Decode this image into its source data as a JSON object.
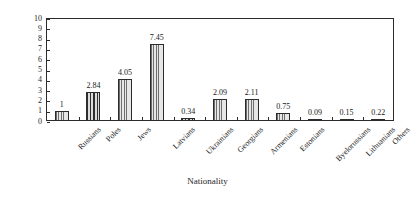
{
  "chart_data": {
    "type": "bar",
    "title": "",
    "xlabel": "Nationality",
    "ylabel": "Percentage",
    "ylim": [
      0,
      10
    ],
    "ytick_labels": [
      "0",
      "1",
      "2",
      "3",
      "4",
      "5",
      "6",
      "7",
      "8",
      "9",
      "10"
    ],
    "ytick_values": [
      0,
      1,
      2,
      3,
      4,
      5,
      6,
      7,
      8,
      9,
      10
    ],
    "grid": false,
    "legend": "none",
    "categories": [
      "Russians",
      "Poles",
      "Jews",
      "Latvians",
      "Ukrainians",
      "Georgians",
      "Armenians",
      "Estonians",
      "Byelorussians",
      "Lithuanians",
      "Others"
    ],
    "values": [
      1,
      2.84,
      4.05,
      7.45,
      0.34,
      2.09,
      2.11,
      0.75,
      0.09,
      0.15,
      0.22
    ],
    "value_labels": [
      "1",
      "2.84",
      "4.05",
      "7.45",
      "0.34",
      "2.09",
      "2.11",
      "0.75",
      "0.09",
      "0.15",
      "0.22"
    ],
    "bar_styles": [
      "hatch-light",
      "hatch-dark",
      "hatch-light",
      "hatch-light",
      "hatch-dark",
      "hatch-light",
      "hatch-light",
      "hatch-light",
      "hatch-dark",
      "hatch-dark",
      "hatch-dark"
    ]
  },
  "colors": {
    "axis": "#2b2b2b",
    "text": "#262626",
    "bar_fill_light": "#d9d9d9",
    "bar_fill_dark": "#bdbdbd",
    "background": "#ffffff"
  }
}
